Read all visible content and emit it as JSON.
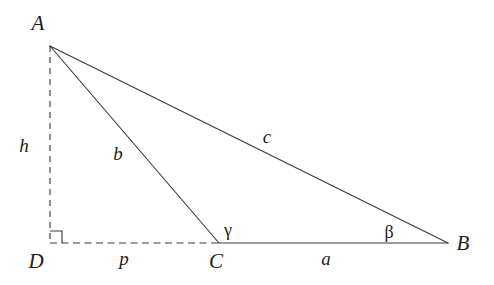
{
  "diagram": {
    "type": "geometry-triangle",
    "canvas": {
      "width": 494,
      "height": 285,
      "background": "#ffffff"
    },
    "stroke_color": "#3b3b3b",
    "text_color": "#1d1d1d",
    "vertices": [
      {
        "id": "A",
        "label": "A",
        "x": 50,
        "y": 46,
        "label_x": 38,
        "label_y": 30
      },
      {
        "id": "B",
        "label": "B",
        "x": 448,
        "y": 243,
        "label_x": 458,
        "label_y": 250
      },
      {
        "id": "C",
        "label": "C",
        "x": 219,
        "y": 243,
        "label_x": 211,
        "label_y": 268
      },
      {
        "id": "D",
        "label": "D",
        "x": 50,
        "y": 243,
        "label_x": 31,
        "label_y": 268
      }
    ],
    "edges": [
      {
        "id": "AB",
        "style": "solid",
        "from": "A",
        "to": "B",
        "x1": 50,
        "y1": 46,
        "x2": 448,
        "y2": 243
      },
      {
        "id": "AC",
        "style": "solid",
        "from": "A",
        "to": "C",
        "x1": 50,
        "y1": 46,
        "x2": 219,
        "y2": 243
      },
      {
        "id": "CB",
        "style": "solid",
        "from": "C",
        "to": "B",
        "x1": 219,
        "y1": 243,
        "x2": 448,
        "y2": 243
      },
      {
        "id": "AD",
        "style": "dashed",
        "from": "A",
        "to": "D",
        "x1": 50,
        "y1": 46,
        "x2": 50,
        "y2": 243
      },
      {
        "id": "DC",
        "style": "dashed",
        "from": "D",
        "to": "C",
        "x1": 50,
        "y1": 243,
        "x2": 219,
        "y2": 243
      }
    ],
    "side_labels": [
      {
        "id": "c",
        "label": "c",
        "edge": "AB",
        "x": 267,
        "y": 143
      },
      {
        "id": "b",
        "label": "b",
        "edge": "AC",
        "x": 118,
        "y": 160
      },
      {
        "id": "a",
        "label": "a",
        "edge": "CB",
        "x": 326,
        "y": 265
      },
      {
        "id": "h",
        "label": "h",
        "edge": "AD",
        "x": 22,
        "y": 152
      },
      {
        "id": "p",
        "label": "p",
        "edge": "DC",
        "x": 124,
        "y": 265
      }
    ],
    "angle_labels": [
      {
        "id": "gamma",
        "label": "γ",
        "at_vertex": "C",
        "x": 224,
        "y": 236
      },
      {
        "id": "beta",
        "label": "β",
        "at_vertex": "B",
        "x": 385,
        "y": 238
      }
    ],
    "right_angle": {
      "id": "right-angle-at-D",
      "at_vertex": "D",
      "size": 12,
      "path": "M 50 231 L 62 231 L 62 243"
    }
  }
}
